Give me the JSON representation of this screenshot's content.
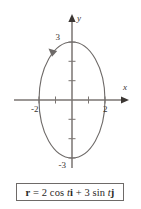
{
  "figure": {
    "caption_box": {
      "equation_plain": "r = 2 cos ti + 3 sin tj",
      "parts": {
        "lhs_vector": "r",
        "equals": "=",
        "term1_coeff": "2",
        "term1_func": "cos",
        "term1_var": "t",
        "term1_unit": "i",
        "plus": "+",
        "term2_coeff": "3",
        "term2_func": "sin",
        "term2_var": "t",
        "term2_unit": "j"
      }
    },
    "axes": {
      "x_label": "x",
      "y_label": "y",
      "x_tick_labels": [
        "-2",
        "2"
      ],
      "y_tick_labels": [
        "3",
        "-3"
      ],
      "x_ticks_unlabeled": [
        -1,
        1
      ],
      "y_ticks_unlabeled": [
        -2,
        -1,
        1,
        2
      ],
      "color": "#7a7572"
    },
    "curve": {
      "direction_arrow": "counterclockwise",
      "color": "#6e6a68"
    }
  },
  "chart_data": {
    "type": "line",
    "title": "",
    "subtitle": "",
    "xlabel": "x",
    "ylabel": "y",
    "grid": false,
    "legend": null,
    "xlim": [
      -2.6,
      2.6
    ],
    "ylim": [
      -3.6,
      3.6
    ],
    "xticks": [
      -2,
      -1,
      1,
      2
    ],
    "yticks": [
      -3,
      -2,
      -1,
      1,
      2,
      3
    ],
    "xticklabels": [
      "-2",
      "",
      "",
      "2"
    ],
    "yticklabels": [
      "-3",
      "",
      "",
      "",
      "",
      "3"
    ],
    "parametric": true,
    "equation": "r = 2 cos(t) i + 3 sin(t) j",
    "series": [
      {
        "name": "ellipse",
        "kind": "parametric-ellipse",
        "semi_axis_x": 2,
        "semi_axis_y": 3,
        "center": [
          0,
          0
        ],
        "orientation": "counterclockwise",
        "t_range": [
          0,
          6.283185307
        ],
        "x": [
          2.0,
          1.73,
          1.0,
          0.0,
          -1.0,
          -1.73,
          -2.0,
          -1.73,
          -1.0,
          0.0,
          1.0,
          1.73,
          2.0
        ],
        "y": [
          0.0,
          1.5,
          2.6,
          3.0,
          2.6,
          1.5,
          0.0,
          -1.5,
          -2.6,
          -3.0,
          -2.6,
          -1.5,
          0.0
        ]
      }
    ],
    "annotations": [
      {
        "text": "3",
        "x": 0,
        "y": 3,
        "placement": "upper-left-of-point"
      },
      {
        "text": "-3",
        "x": 0,
        "y": -3,
        "placement": "lower-left-of-point"
      },
      {
        "text": "2",
        "x": 2,
        "y": 0,
        "placement": "below-right-of-point"
      },
      {
        "text": "-2",
        "x": -2,
        "y": 0,
        "placement": "below-left-of-point"
      },
      {
        "text": "direction arrow",
        "x": -0.85,
        "y": 2.72,
        "placement": "on-curve"
      }
    ]
  }
}
